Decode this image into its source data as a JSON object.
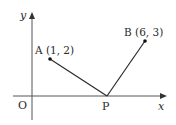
{
  "diagram": {
    "type": "coordinate-plane",
    "axes": {
      "x_label": "x",
      "y_label": "y",
      "origin_label": "O"
    },
    "points": [
      {
        "name": "A",
        "label": "A (1, 2)",
        "x": 1,
        "y": 2
      },
      {
        "name": "B",
        "label": "B (6, 3)",
        "x": 6,
        "y": 3
      },
      {
        "name": "P",
        "label": "P"
      }
    ],
    "segments": [
      {
        "from": "A",
        "to": "P"
      },
      {
        "from": "P",
        "to": "B"
      }
    ],
    "colors": {
      "stroke": "#2a2a2a",
      "axis": "#555555",
      "background": "#ffffff"
    }
  }
}
